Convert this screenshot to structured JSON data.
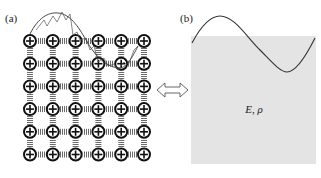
{
  "panels": {
    "a": {
      "label": "(a)",
      "description": "Discrete lattice of masses connected by springs with a propagating wave",
      "lattice": {
        "rows": 6,
        "cols": 6,
        "node_glyph": "circle-plus",
        "connector": "spring"
      }
    },
    "b": {
      "label": "(b)",
      "description": "Continuum medium with a propagating wave",
      "material_label": "E, ρ",
      "fill_color": "#e4e4e4"
    }
  },
  "equivalence_arrow": {
    "icon": "double-arrow-icon"
  },
  "colors": {
    "ink": "#1a1a1a",
    "spring": "#7a7a7a",
    "wave": "#333333",
    "medium": "#e4e4e4"
  }
}
